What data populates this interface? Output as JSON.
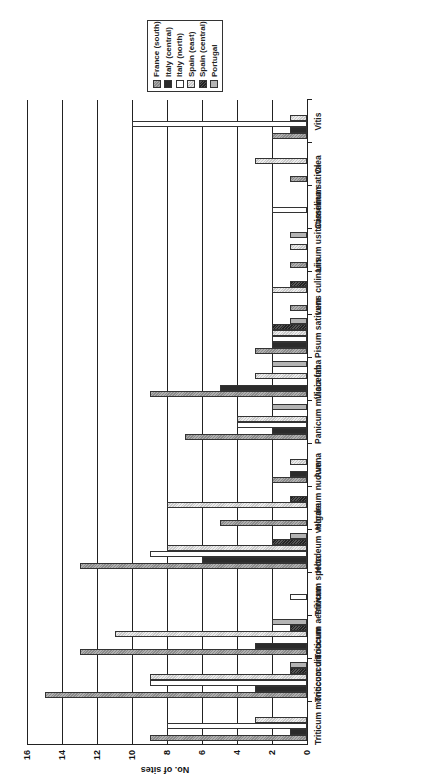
{
  "chart_data": {
    "type": "bar",
    "orientation": "vertical bars, image rotated 90° counter-clockwise",
    "title": "",
    "xlabel": "",
    "ylabel": "No. of sites",
    "ylim": [
      0,
      16
    ],
    "yticks": [
      0,
      2,
      4,
      6,
      8,
      10,
      12,
      14,
      16
    ],
    "grid": true,
    "legend_position": "top-right",
    "categories": [
      "Triticum monococcum",
      "Triticum dicoccum",
      "Triticum aestivum",
      "Triticum spelta",
      "Hordeum vulgare",
      "Hordeum nudum",
      "Avena",
      "Panicum miliaceum",
      "Vicia faba",
      "Pisum sativum",
      "Lens culinaris",
      "Linum usitatissimum",
      "Camelina sativa",
      "Olea",
      "Vitis"
    ],
    "series": [
      {
        "name": "France (south)",
        "color": "#9a9a9a",
        "pattern": "dotted-dark",
        "values": [
          9,
          15,
          13,
          0,
          13,
          5,
          2,
          7,
          9,
          3,
          1,
          1,
          0,
          1,
          2
        ]
      },
      {
        "name": "Italy (central)",
        "color": "#2b2b2b",
        "pattern": "solid-dark",
        "values": [
          1,
          3,
          3,
          0,
          6,
          0,
          1,
          2,
          5,
          2,
          0,
          0,
          0,
          0,
          1
        ]
      },
      {
        "name": "Italy (north)",
        "color": "#ffffff",
        "pattern": "white",
        "values": [
          8,
          9,
          0,
          1,
          9,
          0,
          0,
          4,
          0,
          2,
          0,
          0,
          2,
          0,
          10
        ]
      },
      {
        "name": "Spain (east)",
        "color": "#d6d6d6",
        "pattern": "dotted-light",
        "values": [
          3,
          9,
          11,
          0,
          8,
          8,
          1,
          4,
          3,
          2,
          2,
          1,
          0,
          3,
          1
        ]
      },
      {
        "name": "Spain (central)",
        "color": "#3a3a3a",
        "pattern": "checker-dark",
        "values": [
          0,
          1,
          1,
          0,
          2,
          1,
          0,
          0,
          0,
          2,
          1,
          0,
          0,
          0,
          0
        ]
      },
      {
        "name": "Portugal",
        "color": "#b4b4b4",
        "pattern": "gray",
        "values": [
          0,
          1,
          2,
          0,
          1,
          0,
          0,
          2,
          2,
          1,
          0,
          1,
          0,
          0,
          0
        ]
      }
    ]
  },
  "legend": {
    "items": [
      {
        "label": "France (south)",
        "color": "#9a9a9a"
      },
      {
        "label": "Italy (central)",
        "color": "#2b2b2b"
      },
      {
        "label": "Italy (north)",
        "color": "#ffffff"
      },
      {
        "label": "Spain (east)",
        "color": "#d6d6d6"
      },
      {
        "label": "Spain (central)",
        "color": "#3a3a3a"
      },
      {
        "label": "Portugal",
        "color": "#b4b4b4"
      }
    ]
  },
  "axis": {
    "y_title": "No. of sites",
    "y_ticks": [
      "0",
      "2",
      "4",
      "6",
      "8",
      "10",
      "12",
      "14",
      "16"
    ]
  }
}
